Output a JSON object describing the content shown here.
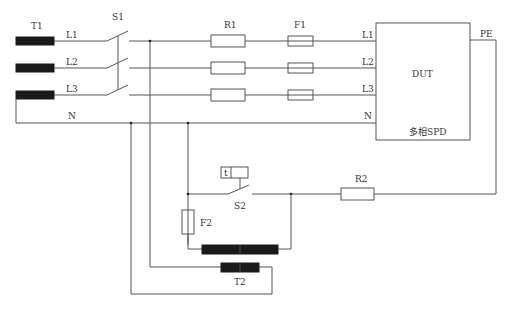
{
  "diagram": {
    "title": "",
    "components": {
      "t1": {
        "label": "T1"
      },
      "s1": {
        "label": "S1"
      },
      "r1": {
        "label": "R1"
      },
      "f1": {
        "label": "F1"
      },
      "dut": {
        "label": "DUT",
        "sublabel": "多相SPD"
      },
      "s2": {
        "label": "S2",
        "timer_label": "t"
      },
      "f2": {
        "label": "F2"
      },
      "r2": {
        "label": "R2"
      },
      "t2": {
        "label": "T2"
      }
    },
    "lines": {
      "l1": "L1",
      "l2": "L2",
      "l3": "L3",
      "n": "N",
      "pe": "PE"
    },
    "terminals": {
      "dut_l1": "L1",
      "dut_l2": "L2",
      "dut_l3": "L3",
      "dut_n": "N"
    }
  }
}
